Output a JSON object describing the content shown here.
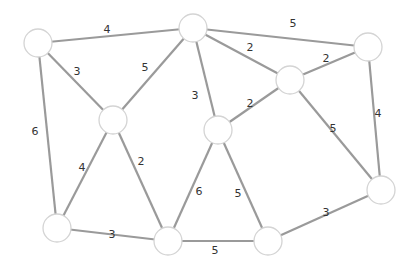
{
  "graph": {
    "node_radius": 14,
    "nodes": [
      {
        "id": "A",
        "x": 38,
        "y": 43
      },
      {
        "id": "B",
        "x": 193,
        "y": 28
      },
      {
        "id": "C",
        "x": 368,
        "y": 47
      },
      {
        "id": "D",
        "x": 290,
        "y": 80
      },
      {
        "id": "E",
        "x": 113,
        "y": 120
      },
      {
        "id": "F",
        "x": 218,
        "y": 130
      },
      {
        "id": "G",
        "x": 381,
        "y": 190
      },
      {
        "id": "H",
        "x": 57,
        "y": 228
      },
      {
        "id": "I",
        "x": 168,
        "y": 241
      },
      {
        "id": "J",
        "x": 268,
        "y": 241
      }
    ],
    "edges": [
      {
        "from": "A",
        "to": "B",
        "weight": "4",
        "lx": 107,
        "ly": 30
      },
      {
        "from": "A",
        "to": "E",
        "weight": "3",
        "lx": 77,
        "ly": 72
      },
      {
        "from": "A",
        "to": "H",
        "weight": "6",
        "lx": 35,
        "ly": 132
      },
      {
        "from": "B",
        "to": "E",
        "weight": "5",
        "lx": 145,
        "ly": 68
      },
      {
        "from": "B",
        "to": "F",
        "weight": "3",
        "lx": 195,
        "ly": 96
      },
      {
        "from": "B",
        "to": "C",
        "weight": "5",
        "lx": 293,
        "ly": 24
      },
      {
        "from": "B",
        "to": "D",
        "weight": "2",
        "lx": 250,
        "ly": 48
      },
      {
        "from": "D",
        "to": "C",
        "weight": "2",
        "lx": 326,
        "ly": 59
      },
      {
        "from": "D",
        "to": "F",
        "weight": "2",
        "lx": 250,
        "ly": 104
      },
      {
        "from": "D",
        "to": "G",
        "weight": "5",
        "lx": 333,
        "ly": 129
      },
      {
        "from": "C",
        "to": "G",
        "weight": "4",
        "lx": 378,
        "ly": 114
      },
      {
        "from": "E",
        "to": "H",
        "weight": "4",
        "lx": 82,
        "ly": 168
      },
      {
        "from": "E",
        "to": "I",
        "weight": "2",
        "lx": 141,
        "ly": 162
      },
      {
        "from": "F",
        "to": "I",
        "weight": "6",
        "lx": 199,
        "ly": 192
      },
      {
        "from": "F",
        "to": "J",
        "weight": "5",
        "lx": 238,
        "ly": 194
      },
      {
        "from": "H",
        "to": "I",
        "weight": "3",
        "lx": 112,
        "ly": 235
      },
      {
        "from": "I",
        "to": "J",
        "weight": "5",
        "lx": 215,
        "ly": 251
      },
      {
        "from": "J",
        "to": "G",
        "weight": "3",
        "lx": 326,
        "ly": 213
      }
    ]
  },
  "colors": {
    "edge": "#9a9a9a",
    "node_stroke": "#d4d4d4",
    "node_fill": "#ffffff",
    "label": "#333333"
  }
}
